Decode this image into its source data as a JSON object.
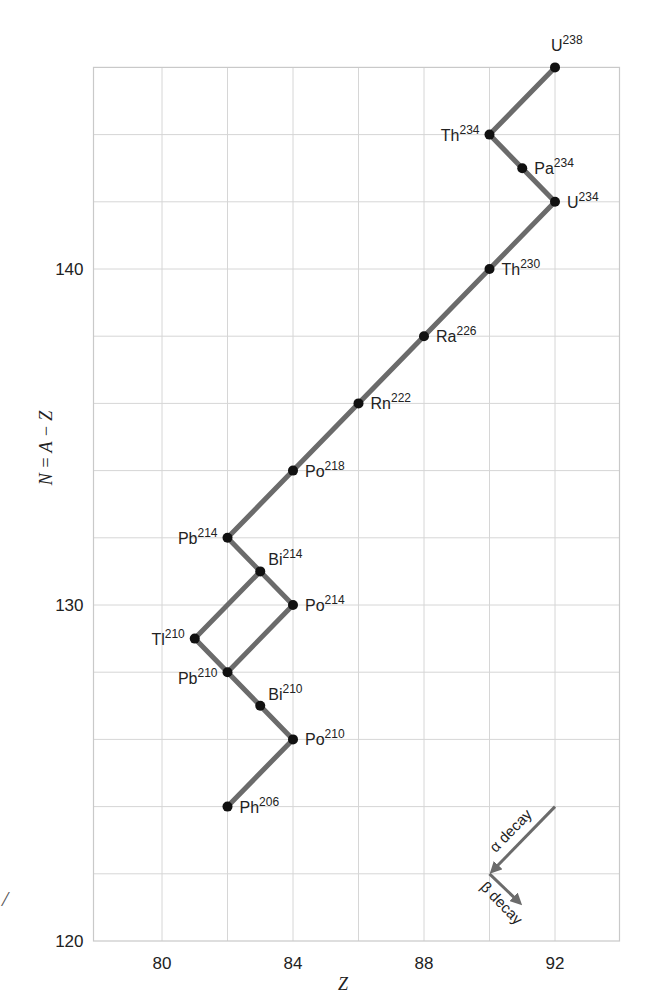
{
  "chart_data": {
    "type": "line",
    "title": "",
    "xlabel": "Z",
    "ylabel": "N = A − Z",
    "xlim": [
      78,
      94
    ],
    "ylim": [
      120,
      146
    ],
    "x_ticks": [
      80,
      84,
      88,
      92
    ],
    "y_ticks": [
      120,
      130,
      140
    ],
    "x_grid_step": 2,
    "y_grid_step": 2,
    "grid": true,
    "nuclides": [
      {
        "symbol": "U",
        "mass": "238",
        "Z": 92,
        "N": 146,
        "label_pos": "above"
      },
      {
        "symbol": "Th",
        "mass": "234",
        "Z": 90,
        "N": 144,
        "label_pos": "left"
      },
      {
        "symbol": "Pa",
        "mass": "234",
        "Z": 91,
        "N": 143,
        "label_pos": "right"
      },
      {
        "symbol": "U",
        "mass": "234",
        "Z": 92,
        "N": 142,
        "label_pos": "right"
      },
      {
        "symbol": "Th",
        "mass": "230",
        "Z": 90,
        "N": 140,
        "label_pos": "right"
      },
      {
        "symbol": "Ra",
        "mass": "226",
        "Z": 88,
        "N": 138,
        "label_pos": "right"
      },
      {
        "symbol": "Rn",
        "mass": "222",
        "Z": 86,
        "N": 136,
        "label_pos": "right"
      },
      {
        "symbol": "Po",
        "mass": "218",
        "Z": 84,
        "N": 134,
        "label_pos": "right"
      },
      {
        "symbol": "Pb",
        "mass": "214",
        "Z": 82,
        "N": 132,
        "label_pos": "left"
      },
      {
        "symbol": "Bi",
        "mass": "214",
        "Z": 83,
        "N": 131,
        "label_pos": "upright"
      },
      {
        "symbol": "Po",
        "mass": "214",
        "Z": 84,
        "N": 130,
        "label_pos": "right"
      },
      {
        "symbol": "Tl",
        "mass": "210",
        "Z": 81,
        "N": 129,
        "label_pos": "left"
      },
      {
        "symbol": "Pb",
        "mass": "210",
        "Z": 82,
        "N": 128,
        "label_pos": "lowleft"
      },
      {
        "symbol": "Bi",
        "mass": "210",
        "Z": 83,
        "N": 127,
        "label_pos": "upright"
      },
      {
        "symbol": "Po",
        "mass": "210",
        "Z": 84,
        "N": 126,
        "label_pos": "right"
      },
      {
        "symbol": "Ph",
        "mass": "206",
        "Z": 82,
        "N": 124,
        "label_pos": "right"
      }
    ],
    "segments": [
      [
        [
          92,
          146
        ],
        [
          90,
          144
        ]
      ],
      [
        [
          90,
          144
        ],
        [
          92,
          142
        ]
      ],
      [
        [
          92,
          142
        ],
        [
          82,
          132
        ]
      ],
      [
        [
          82,
          132
        ],
        [
          84,
          130
        ]
      ],
      [
        [
          83,
          131
        ],
        [
          81,
          129
        ]
      ],
      [
        [
          84,
          130
        ],
        [
          82,
          128
        ]
      ],
      [
        [
          81,
          129
        ],
        [
          84,
          126
        ]
      ],
      [
        [
          84,
          126
        ],
        [
          82,
          124
        ]
      ]
    ],
    "legend": {
      "alpha_label": "α decay",
      "beta_label": "β decay",
      "origin": [
        90,
        122
      ],
      "alpha_from": [
        92,
        124
      ],
      "beta_to": [
        91,
        121
      ]
    },
    "colors": {
      "path": "#6b6b6b",
      "dot": "#111111",
      "grid": "#d6d6d6",
      "text": "#222222",
      "arrow": "#6b6b6b"
    }
  },
  "edge_fragment": "/"
}
